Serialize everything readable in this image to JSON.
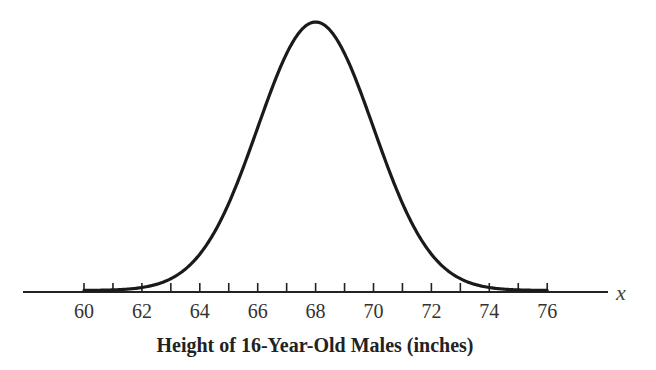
{
  "chart_data": {
    "type": "line",
    "subtype": "normal-distribution-curve",
    "title": "",
    "xlabel": "Height of 16-Year-Old Males (inches)",
    "x_variable": "x",
    "ylabel": "",
    "distribution": {
      "mean": 68,
      "std_dev": 2
    },
    "xlim": [
      58,
      77.5
    ],
    "x_ticks_minor": [
      60,
      61,
      62,
      63,
      64,
      65,
      66,
      67,
      68,
      69,
      70,
      71,
      72,
      73,
      74,
      75,
      76
    ],
    "x_tick_labels": [
      "60",
      "62",
      "64",
      "66",
      "68",
      "70",
      "72",
      "74",
      "76"
    ],
    "y_axis_shown": false,
    "grid": false,
    "legend": null,
    "colors": {
      "curve": "#1a1a1a",
      "axis": "#222222",
      "text": "#333333"
    }
  }
}
